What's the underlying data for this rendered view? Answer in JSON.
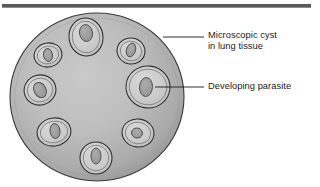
{
  "figure": {
    "background_color": "#ffffff",
    "top_rule_color": "#5a5a5a"
  },
  "labels": [
    {
      "id": "microscopic-cyst",
      "lines": [
        "Microscopic cyst",
        "in lung tissue"
      ],
      "leader": {
        "x1": 163,
        "y1": 37,
        "x2": 204,
        "y2": 37
      }
    },
    {
      "id": "developing-parasite",
      "lines": [
        "Developing parasite"
      ],
      "leader": {
        "x1": 155,
        "y1": 87,
        "x2": 204,
        "y2": 87
      }
    }
  ],
  "diagram": {
    "cyst": {
      "name": "microscopic-cyst",
      "cx": 97,
      "cy": 97,
      "rx": 87,
      "ry": 84,
      "fill_center": "#c4c4c4",
      "fill_edge": "#8f8f8f",
      "outline": "#3a3a3a"
    },
    "parasites": [
      {
        "name": "parasite-top",
        "cx": 86,
        "cy": 37,
        "rx": 17,
        "ry": 19,
        "rot": -8,
        "nx": 86,
        "ny": 33,
        "nrx": 6.5,
        "nry": 8.5,
        "nrot": -10
      },
      {
        "name": "parasite-upper-left",
        "cx": 48,
        "cy": 55,
        "rx": 14,
        "ry": 12,
        "rot": -12,
        "nx": 48,
        "ny": 55,
        "nrx": 4.5,
        "nry": 6.5,
        "nrot": -8
      },
      {
        "name": "parasite-upper-right",
        "cx": 131,
        "cy": 51,
        "rx": 14,
        "ry": 13,
        "rot": 12,
        "nx": 131,
        "ny": 50,
        "nrx": 4.5,
        "nry": 7,
        "nrot": 18
      },
      {
        "name": "parasite-left",
        "cx": 40,
        "cy": 90,
        "rx": 16,
        "ry": 15,
        "rot": -15,
        "nx": 40,
        "ny": 90,
        "nrx": 6,
        "nry": 8,
        "nrot": -28
      },
      {
        "name": "parasite-large-right",
        "cx": 148,
        "cy": 87,
        "rx": 22,
        "ry": 21,
        "rot": 6,
        "nx": 146,
        "ny": 87,
        "nrx": 6.5,
        "nry": 9.5,
        "nrot": 4
      },
      {
        "name": "parasite-lower-left",
        "cx": 54,
        "cy": 132,
        "rx": 17,
        "ry": 14,
        "rot": -10,
        "nx": 55,
        "ny": 131,
        "nrx": 5,
        "nry": 7.5,
        "nrot": -6
      },
      {
        "name": "parasite-bottom",
        "cx": 96,
        "cy": 158,
        "rx": 16,
        "ry": 16,
        "rot": 0,
        "nx": 96,
        "ny": 156,
        "nrx": 5,
        "nry": 8,
        "nrot": 0
      },
      {
        "name": "parasite-lower-right",
        "cx": 138,
        "cy": 133,
        "rx": 16,
        "ry": 14,
        "rot": 8,
        "nx": 137,
        "ny": 133,
        "nrx": 5.5,
        "nry": 5,
        "nrot": 10
      }
    ],
    "parasite_style": {
      "fill_outer": "#cfcfcf",
      "fill_inner": "#c9c9c9",
      "nucleus_fill": "#9e9e9e",
      "outline": "#2f2f2f"
    }
  }
}
